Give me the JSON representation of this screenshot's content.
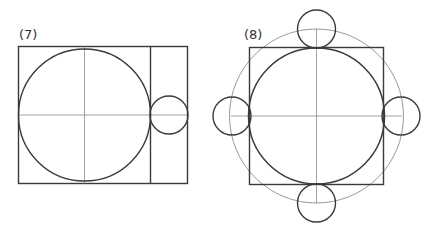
{
  "figures": [
    {
      "label": "(7)",
      "description": "Rectangle containing a large inscribed circle with crosshair guides; a vertical divider separates a narrow strip holding a small circle tangent to the large circle on the horizontal axis"
    },
    {
      "label": "(8)",
      "description": "Square with inscribed circle and crosshair guides; a larger gray circle through the midpoints; four small circles centered on the gray circle at top, bottom, left and right, each tangent to the inscribed circle"
    }
  ],
  "colors": {
    "stroke": "#3a3a3a",
    "guide": "#8a8a8a",
    "outer_circle": "#9a9a9a",
    "background": "#ffffff"
  }
}
